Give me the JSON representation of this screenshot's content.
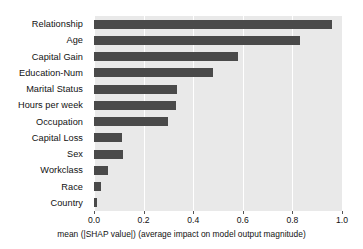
{
  "chart_data": {
    "type": "bar",
    "orientation": "horizontal",
    "title": "",
    "xlabel": "mean (|SHAP value|) (average impact on model output magnitude)",
    "ylabel": "",
    "xlim": [
      0.0,
      1.0
    ],
    "grid": true,
    "legend": null,
    "categories": [
      "Relationship",
      "Age",
      "Capital Gain",
      "Education-Num",
      "Marital Status",
      "Hours per week",
      "Occupation",
      "Capital Loss",
      "Sex",
      "Workclass",
      "Race",
      "Country"
    ],
    "values": [
      0.96,
      0.83,
      0.58,
      0.48,
      0.335,
      0.33,
      0.3,
      0.113,
      0.117,
      0.056,
      0.03,
      0.013
    ],
    "xticks": [
      "0.0",
      "0.2",
      "0.4",
      "0.6",
      "0.8",
      "1.0"
    ],
    "xtick_values": [
      0.0,
      0.2,
      0.4,
      0.6,
      0.8,
      1.0
    ],
    "bar_color": "#4a4a4a",
    "plot_background": "#e9e9e9",
    "gridline_color": "#ffffff",
    "figure_background": "#ffffff"
  }
}
